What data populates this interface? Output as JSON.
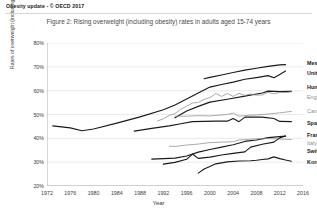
{
  "header": {
    "text": "Obesity update  -  © OECD 2017"
  },
  "figure": {
    "title": "Figure 2: Rising overweight (including obesity) rates in adults aged 15-74 years"
  },
  "chart_data": {
    "type": "line",
    "title": "Figure 2: Rising overweight (including obesity) rates in adults aged 15-74 years",
    "xlabel": "Year",
    "ylabel": "Rates of overweight (including obesity)",
    "xlim": [
      1972,
      2016
    ],
    "ylim": [
      20,
      80
    ],
    "grid": true,
    "legend_position": "right-of-plot-inline-labels",
    "xticks": [
      "1972",
      "1976",
      "1980",
      "1984",
      "1988",
      "1992",
      "1996",
      "2000",
      "2004",
      "2008",
      "2012",
      "2016"
    ],
    "yticks": [
      "20%",
      "30%",
      "40%",
      "50%",
      "60%",
      "70%",
      "80%"
    ],
    "series": [
      {
        "name": "Mexico",
        "label_style": "bold",
        "color": "#1a1a1a",
        "label_y_pct": 71.5,
        "points": [
          [
            1999,
            65.0
          ],
          [
            2000,
            65.6
          ],
          [
            2002,
            66.6
          ],
          [
            2004,
            67.6
          ],
          [
            2006,
            68.6
          ],
          [
            2008,
            69.4
          ],
          [
            2010,
            70.2
          ],
          [
            2012,
            70.8
          ],
          [
            2013,
            70.9
          ]
        ]
      },
      {
        "name": "United States",
        "label_style": "bold",
        "color": "#1a1a1a",
        "label_y_pct": 67.5,
        "points": [
          [
            1973,
            45.2
          ],
          [
            1976,
            44.4
          ],
          [
            1978,
            43.2
          ],
          [
            1980,
            43.9
          ],
          [
            1984,
            46.4
          ],
          [
            1988,
            49.0
          ],
          [
            1992,
            52.0
          ],
          [
            1994,
            54.0
          ],
          [
            1996,
            56.5
          ],
          [
            1998,
            59.0
          ],
          [
            2000,
            61.5
          ],
          [
            2002,
            62.6
          ],
          [
            2004,
            63.6
          ],
          [
            2006,
            64.8
          ],
          [
            2008,
            65.5
          ],
          [
            2010,
            66.3
          ],
          [
            2011,
            65.4
          ],
          [
            2012,
            66.8
          ],
          [
            2013,
            68.2
          ]
        ]
      },
      {
        "name": "Hungary",
        "label_style": "bold",
        "color": "#1a1a1a",
        "label_y_pct": 61.5,
        "points": [
          [
            1994,
            48.6
          ],
          [
            1996,
            51.5
          ],
          [
            1998,
            53.4
          ],
          [
            2000,
            55.2
          ],
          [
            2003,
            56.4
          ],
          [
            2006,
            57.7
          ],
          [
            2009,
            59.0
          ],
          [
            2010,
            59.8
          ],
          [
            2012,
            59.6
          ],
          [
            2014,
            59.7
          ]
        ]
      },
      {
        "name": "England",
        "label_style": "gray",
        "color": "#8e8e8e",
        "label_y_pct": 57.5,
        "points": [
          [
            1991,
            47.3
          ],
          [
            1992,
            48.2
          ],
          [
            1993,
            49.6
          ],
          [
            1994,
            50.4
          ],
          [
            1995,
            52.2
          ],
          [
            1996,
            53.5
          ],
          [
            1997,
            54.8
          ],
          [
            1998,
            55.1
          ],
          [
            1999,
            56.3
          ],
          [
            2000,
            57.1
          ],
          [
            2001,
            58.8
          ],
          [
            2002,
            57.6
          ],
          [
            2003,
            58.8
          ],
          [
            2004,
            57.6
          ],
          [
            2005,
            58.9
          ],
          [
            2006,
            58.0
          ],
          [
            2007,
            58.6
          ],
          [
            2008,
            58.1
          ],
          [
            2009,
            58.2
          ],
          [
            2010,
            59.3
          ],
          [
            2011,
            58.7
          ],
          [
            2012,
            59.3
          ],
          [
            2013,
            59.2
          ],
          [
            2014,
            59.5
          ]
        ]
      },
      {
        "name": "Canada",
        "label_style": "gray",
        "color": "#8e8e8e",
        "label_y_pct": 51.5,
        "points": [
          [
            1994,
            49.3
          ],
          [
            1996,
            49.3
          ],
          [
            1998,
            49.5
          ],
          [
            2000,
            49.4
          ],
          [
            2003,
            50.0
          ],
          [
            2004,
            50.6
          ],
          [
            2005,
            49.3
          ],
          [
            2007,
            49.7
          ],
          [
            2008,
            49.8
          ],
          [
            2010,
            50.2
          ],
          [
            2012,
            50.7
          ],
          [
            2014,
            51.3
          ]
        ]
      },
      {
        "name": "Spain",
        "label_style": "bold",
        "color": "#1a1a1a",
        "label_y_pct": 46.5,
        "points": [
          [
            1987,
            43.0
          ],
          [
            1990,
            44.2
          ],
          [
            1993,
            45.2
          ],
          [
            1995,
            46.1
          ],
          [
            1997,
            47.0
          ],
          [
            2001,
            47.2
          ],
          [
            2003,
            47.2
          ],
          [
            2004,
            48.3
          ],
          [
            2005,
            47.0
          ],
          [
            2006,
            48.9
          ],
          [
            2009,
            48.9
          ],
          [
            2011,
            48.3
          ],
          [
            2012,
            47.1
          ],
          [
            2014,
            47.0
          ]
        ]
      },
      {
        "name": "France",
        "label_style": "bold",
        "color": "#1a1a1a",
        "label_y_pct": 41.5,
        "points": [
          [
            1990,
            31.3
          ],
          [
            1992,
            31.5
          ],
          [
            1994,
            31.7
          ],
          [
            1996,
            32.6
          ],
          [
            1998,
            34.2
          ],
          [
            2000,
            35.3
          ],
          [
            2002,
            36.3
          ],
          [
            2004,
            37.3
          ],
          [
            2006,
            38.7
          ],
          [
            2008,
            39.3
          ],
          [
            2010,
            40.3
          ],
          [
            2012,
            40.7
          ],
          [
            2013,
            40.9
          ]
        ]
      },
      {
        "name": "Italy",
        "label_style": "gray",
        "color": "#8e8e8e",
        "label_y_pct": 38.0,
        "points": [
          [
            1993,
            36.7
          ],
          [
            1994,
            36.6
          ],
          [
            1996,
            37.2
          ],
          [
            1998,
            37.6
          ],
          [
            2000,
            38.2
          ],
          [
            2002,
            38.4
          ],
          [
            2004,
            38.6
          ],
          [
            2005,
            39.3
          ],
          [
            2008,
            39.8
          ],
          [
            2010,
            39.9
          ],
          [
            2012,
            39.7
          ],
          [
            2014,
            39.5
          ]
        ]
      },
      {
        "name": "Switzerland",
        "label_style": "bold",
        "color": "#1a1a1a",
        "label_y_pct": 34.5,
        "points": [
          [
            1992,
            29.2
          ],
          [
            1994,
            29.9
          ],
          [
            1996,
            31.2
          ],
          [
            1997,
            33.4
          ],
          [
            1998,
            31.6
          ],
          [
            2000,
            32.1
          ],
          [
            2002,
            33.0
          ],
          [
            2004,
            33.7
          ],
          [
            2006,
            34.3
          ],
          [
            2007,
            36.3
          ],
          [
            2009,
            37.5
          ],
          [
            2011,
            38.4
          ],
          [
            2012,
            40.2
          ],
          [
            2013,
            41.0
          ]
        ]
      },
      {
        "name": "Korea",
        "label_style": "bold",
        "color": "#1a1a1a",
        "label_y_pct": 30.0,
        "points": [
          [
            1998,
            25.4
          ],
          [
            1999,
            27.1
          ],
          [
            2000,
            28.2
          ],
          [
            2001,
            29.3
          ],
          [
            2003,
            30.1
          ],
          [
            2005,
            30.5
          ],
          [
            2007,
            30.6
          ],
          [
            2008,
            30.8
          ],
          [
            2009,
            31.1
          ],
          [
            2010,
            31.4
          ],
          [
            2011,
            32.2
          ],
          [
            2012,
            31.5
          ],
          [
            2013,
            30.9
          ],
          [
            2014,
            30.4
          ]
        ]
      }
    ]
  }
}
